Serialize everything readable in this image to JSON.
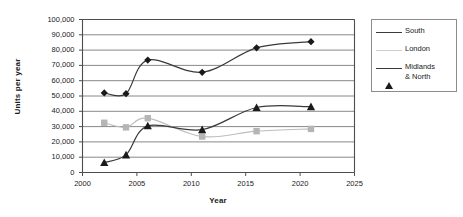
{
  "chart_data": {
    "type": "line",
    "title": "",
    "xlabel": "Year",
    "ylabel": "Units per year",
    "xlim": [
      2000,
      2025
    ],
    "ylim": [
      0,
      100000
    ],
    "grid": true,
    "legend_position": "right",
    "x_ticks": [
      "2000",
      "2005",
      "2010",
      "2015",
      "2020",
      "2025"
    ],
    "x_tick_values": [
      2000,
      2005,
      2010,
      2015,
      2020,
      2025
    ],
    "y_ticks": [
      "0",
      "10,000",
      "20,000",
      "30,000",
      "40,000",
      "50,000",
      "60,000",
      "70,000",
      "80,000",
      "90,000",
      "100,000"
    ],
    "y_tick_values": [
      0,
      10000,
      20000,
      30000,
      40000,
      50000,
      60000,
      70000,
      80000,
      90000,
      100000
    ],
    "x": [
      2002,
      2004,
      2006,
      2011,
      2016,
      2021
    ],
    "series": [
      {
        "name": "South",
        "marker": "diamond",
        "color": "#1a1a1a",
        "line_color": "#3a3a3a",
        "values": [
          52000,
          51500,
          73500,
          65500,
          81500,
          85500
        ]
      },
      {
        "name": "London",
        "marker": "square",
        "color": "#b5b5b5",
        "line_color": "#bdbdbd",
        "values": [
          32500,
          29500,
          35500,
          23500,
          27000,
          28500
        ]
      },
      {
        "name": "Midlands & North",
        "marker": "triangle",
        "color": "#1a1a1a",
        "line_color": "#3a3a3a",
        "values": [
          6500,
          11500,
          30500,
          28000,
          42500,
          43000
        ]
      }
    ]
  },
  "legend": {
    "entries": [
      {
        "label": "South"
      },
      {
        "label": "London"
      },
      {
        "label": "Midlands\n& North"
      }
    ]
  },
  "colors": {
    "axis": "#4d4d4d",
    "gridline": "#7a7a7a",
    "plot_background": "#ffffff",
    "legend_border": "#8c8c8c",
    "south": "#1a1a1a",
    "london": "#b5b5b5",
    "midlands": "#1a1a1a"
  }
}
